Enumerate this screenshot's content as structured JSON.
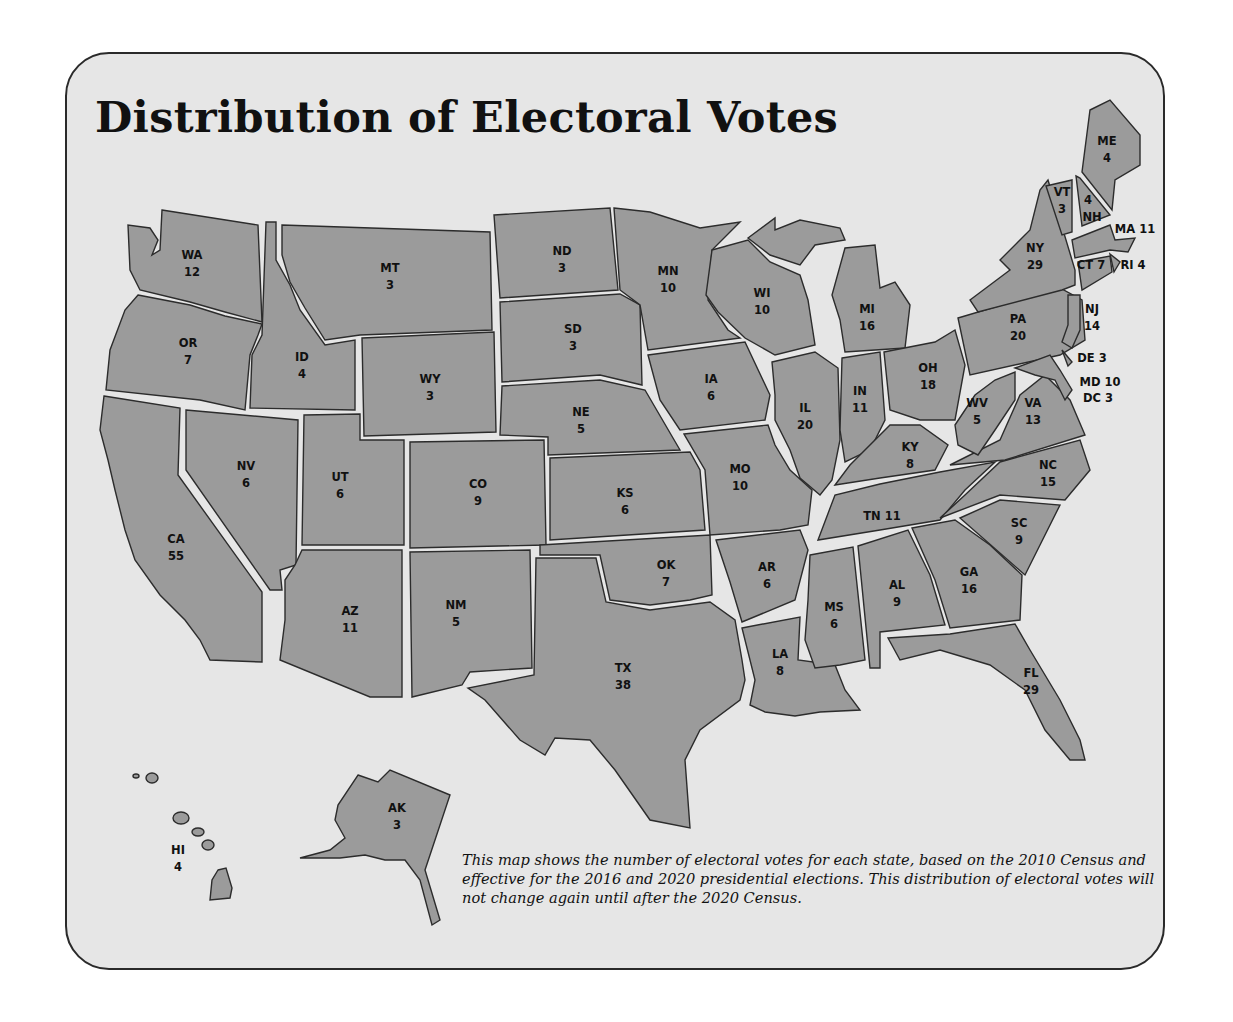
{
  "title": "Distribution of Electoral Votes",
  "caption": "This map shows the number of electoral votes for each state, based on the 2010 Census and effective for the 2016 and 2020 presidential elections. This distribution of electoral votes will not change again until after the 2020 Census.",
  "colors": {
    "state_fill": "#9b9b9b",
    "background": "#e6e6e6",
    "border": "#2a2a2a",
    "text": "#111111"
  },
  "states": {
    "WA": {
      "abbr": "WA",
      "votes": "12"
    },
    "OR": {
      "abbr": "OR",
      "votes": "7"
    },
    "CA": {
      "abbr": "CA",
      "votes": "55"
    },
    "ID": {
      "abbr": "ID",
      "votes": "4"
    },
    "NV": {
      "abbr": "NV",
      "votes": "6"
    },
    "MT": {
      "abbr": "MT",
      "votes": "3"
    },
    "WY": {
      "abbr": "WY",
      "votes": "3"
    },
    "UT": {
      "abbr": "UT",
      "votes": "6"
    },
    "AZ": {
      "abbr": "AZ",
      "votes": "11"
    },
    "CO": {
      "abbr": "CO",
      "votes": "9"
    },
    "NM": {
      "abbr": "NM",
      "votes": "5"
    },
    "ND": {
      "abbr": "ND",
      "votes": "3"
    },
    "SD": {
      "abbr": "SD",
      "votes": "3"
    },
    "NE": {
      "abbr": "NE",
      "votes": "5"
    },
    "KS": {
      "abbr": "KS",
      "votes": "6"
    },
    "OK": {
      "abbr": "OK",
      "votes": "7"
    },
    "TX": {
      "abbr": "TX",
      "votes": "38"
    },
    "MN": {
      "abbr": "MN",
      "votes": "10"
    },
    "IA": {
      "abbr": "IA",
      "votes": "6"
    },
    "MO": {
      "abbr": "MO",
      "votes": "10"
    },
    "AR": {
      "abbr": "AR",
      "votes": "6"
    },
    "LA": {
      "abbr": "LA",
      "votes": "8"
    },
    "WI": {
      "abbr": "WI",
      "votes": "10"
    },
    "IL": {
      "abbr": "IL",
      "votes": "20"
    },
    "MI": {
      "abbr": "MI",
      "votes": "16"
    },
    "IN": {
      "abbr": "IN",
      "votes": "11"
    },
    "OH": {
      "abbr": "OH",
      "votes": "18"
    },
    "KY": {
      "abbr": "KY",
      "votes": "8"
    },
    "TN": {
      "abbr": "TN",
      "votes": "11"
    },
    "MS": {
      "abbr": "MS",
      "votes": "6"
    },
    "AL": {
      "abbr": "AL",
      "votes": "9"
    },
    "GA": {
      "abbr": "GA",
      "votes": "16"
    },
    "FL": {
      "abbr": "FL",
      "votes": "29"
    },
    "SC": {
      "abbr": "SC",
      "votes": "9"
    },
    "NC": {
      "abbr": "NC",
      "votes": "15"
    },
    "VA": {
      "abbr": "VA",
      "votes": "13"
    },
    "WV": {
      "abbr": "WV",
      "votes": "5"
    },
    "PA": {
      "abbr": "PA",
      "votes": "20"
    },
    "NY": {
      "abbr": "NY",
      "votes": "29"
    },
    "VT": {
      "abbr": "VT",
      "votes": "3"
    },
    "NH": {
      "abbr": "NH",
      "votes": "4"
    },
    "ME": {
      "abbr": "ME",
      "votes": "4"
    },
    "MA": {
      "abbr": "MA",
      "votes": "11"
    },
    "RI": {
      "abbr": "RI",
      "votes": "4"
    },
    "CT": {
      "abbr": "CT",
      "votes": "7"
    },
    "NJ": {
      "abbr": "NJ",
      "votes": "14"
    },
    "DE": {
      "abbr": "DE",
      "votes": "3"
    },
    "MD": {
      "abbr": "MD",
      "votes": "10"
    },
    "DC": {
      "abbr": "DC",
      "votes": "3"
    },
    "AK": {
      "abbr": "AK",
      "votes": "3"
    },
    "HI": {
      "abbr": "HI",
      "votes": "4"
    }
  }
}
